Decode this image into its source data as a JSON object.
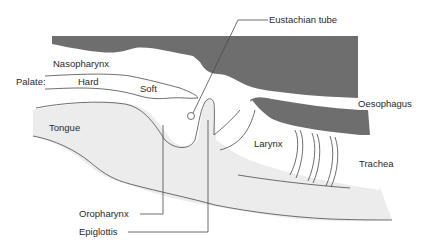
{
  "diagram": {
    "colors": {
      "dark_tissue": "#6e6e6e",
      "light_tissue": "#ececec",
      "outline": "#4a4a4a",
      "background": "#ffffff",
      "text": "#2a2a2a"
    },
    "labels": {
      "eustachian_tube": "Eustachian tube",
      "nasopharynx": "Nasopharynx",
      "palate": "Palate:",
      "hard": "Hard",
      "soft": "Soft",
      "oesophagus": "Oesophagus",
      "tongue": "Tongue",
      "larynx": "Larynx",
      "trachea": "Trachea",
      "oropharynx": "Oropharynx",
      "epiglottis": "Epiglottis"
    }
  }
}
